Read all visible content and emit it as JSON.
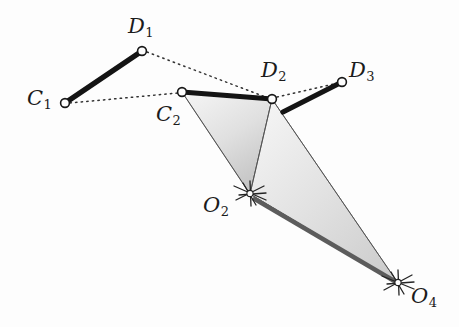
{
  "figure": {
    "kind": "kinematic-linkage-diagram",
    "background_color": "#fdfdfd",
    "ink_color": "#1b1b1b",
    "coupler_bar_color": "#141414",
    "ground_bar_color": "#595959",
    "shade_fill_light": "#f0f0f0",
    "shade_fill_dark": "#c8c8c8",
    "outline_thin_color": "#4a4a4a",
    "dotted_color": "#3a3a3a"
  },
  "labels": {
    "c1": {
      "text": "C",
      "sub": "1",
      "x": 27,
      "y": 88
    },
    "c2": {
      "text": "C",
      "sub": "2",
      "x": 156,
      "y": 104
    },
    "d1": {
      "text": "D",
      "sub": "1",
      "x": 128,
      "y": 16
    },
    "d2": {
      "text": "D",
      "sub": "2",
      "x": 261,
      "y": 60
    },
    "d3": {
      "text": "D",
      "sub": "3",
      "x": 349,
      "y": 60
    },
    "o2": {
      "text": "O",
      "sub": "2",
      "x": 203,
      "y": 195
    },
    "o4": {
      "text": "O",
      "sub": "4",
      "x": 411,
      "y": 286
    }
  },
  "nodes": {
    "C1": {
      "x": 65,
      "y": 103,
      "r": 4.6,
      "kind": "pin-joint-open-circle"
    },
    "D1": {
      "x": 142,
      "y": 51,
      "r": 4.6,
      "kind": "pin-joint-open-circle"
    },
    "C2": {
      "x": 182,
      "y": 92,
      "r": 4.6,
      "kind": "pin-joint-open-circle"
    },
    "D2": {
      "x": 272,
      "y": 99,
      "r": 4.6,
      "kind": "pin-joint-open-circle"
    },
    "D3": {
      "x": 342,
      "y": 82,
      "r": 4.6,
      "kind": "pin-joint-open-circle"
    },
    "O2": {
      "x": 250,
      "y": 194,
      "kind": "ground-pivot-hatch"
    },
    "O4": {
      "x": 398,
      "y": 283,
      "kind": "ground-pivot-hatch"
    }
  },
  "coupler_bars": [
    {
      "name": "bar-C1-D1",
      "from": "C1",
      "to": "D1",
      "x1": 65,
      "y1": 103,
      "x2": 142,
      "y2": 51,
      "width": 5.2
    },
    {
      "name": "bar-C2-D2",
      "from": "C2",
      "to": "D2",
      "x1": 182,
      "y1": 92,
      "x2": 272,
      "y2": 99,
      "width": 5.2
    },
    {
      "name": "bar-D2ext-D3",
      "from": "D2-extension",
      "to": "D3",
      "x1": 283,
      "y1": 112,
      "x2": 342,
      "y2": 82,
      "width": 5.2
    }
  ],
  "ground_bar": {
    "name": "bar-O2-O4",
    "from": "O2",
    "to": "O4",
    "x1": 253,
    "y1": 198,
    "x2": 396,
    "y2": 282,
    "width": 4.4
  },
  "dotted_paths": [
    {
      "name": "dotted-C1-C2",
      "x1": 70,
      "y1": 103,
      "x2": 178,
      "y2": 93
    },
    {
      "name": "dotted-D1-D2",
      "x1": 147,
      "y1": 52,
      "x2": 268,
      "y2": 98
    },
    {
      "name": "dotted-D2-D3",
      "x1": 277,
      "y1": 97,
      "x2": 338,
      "y2": 83
    }
  ],
  "shaded_triangles": [
    {
      "name": "triangle-C2-D2-O2",
      "vertices": [
        [
          182,
          92
        ],
        [
          272,
          99
        ],
        [
          250,
          194
        ]
      ],
      "fill_start": "#f4f4f4",
      "fill_end": "#c9c9c9"
    },
    {
      "name": "triangle-D2-O2-O4",
      "vertices": [
        [
          272,
          99
        ],
        [
          250,
          194
        ],
        [
          398,
          283
        ]
      ],
      "fill_start": "#f3f3f3",
      "fill_end": "#cdcdcd"
    }
  ],
  "thin_lines": [
    {
      "name": "line-C2-O2",
      "x1": 182,
      "y1": 92,
      "x2": 250,
      "y2": 194
    },
    {
      "name": "line-D2-O2",
      "x1": 272,
      "y1": 99,
      "x2": 250,
      "y2": 194
    },
    {
      "name": "line-D2-O4",
      "x1": 272,
      "y1": 99,
      "x2": 398,
      "y2": 283
    },
    {
      "name": "line-O2-O4-upper",
      "x1": 250,
      "y1": 194,
      "x2": 398,
      "y2": 283
    }
  ],
  "hatch_marks": {
    "o2": [
      {
        "x1": 234,
        "y1": 186,
        "x2": 266,
        "y2": 200
      },
      {
        "x1": 236,
        "y1": 200,
        "x2": 264,
        "y2": 186
      },
      {
        "x1": 250,
        "y1": 181,
        "x2": 251,
        "y2": 206
      },
      {
        "x1": 239,
        "y1": 194,
        "x2": 265,
        "y2": 193
      },
      {
        "x1": 243,
        "y1": 183,
        "x2": 256,
        "y2": 205
      }
    ],
    "o4": [
      {
        "x1": 382,
        "y1": 276,
        "x2": 414,
        "y2": 289
      },
      {
        "x1": 384,
        "y1": 290,
        "x2": 412,
        "y2": 275
      },
      {
        "x1": 398,
        "y1": 270,
        "x2": 399,
        "y2": 295
      },
      {
        "x1": 387,
        "y1": 283,
        "x2": 413,
        "y2": 282
      },
      {
        "x1": 391,
        "y1": 272,
        "x2": 404,
        "y2": 294
      }
    ]
  }
}
